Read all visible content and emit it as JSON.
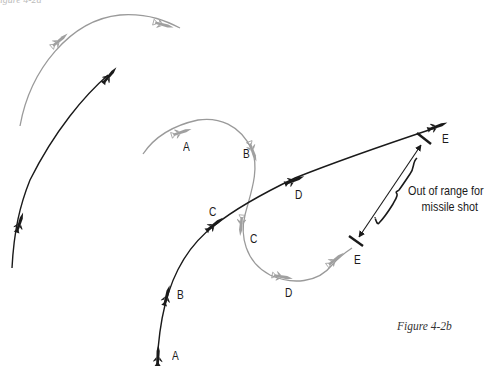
{
  "figure": {
    "caption": "Figure 4-2b",
    "top_fragment": "igure 4-2a",
    "annotation": {
      "line1": "Out of range for",
      "line2": "missile shot"
    }
  },
  "colors": {
    "friendly_path": "#1a1a1a",
    "bandit_path": "#9a9a9a",
    "background": "#ffffff"
  },
  "left_panel": {
    "description": "Earlier engagement: gray bandit arc over black fighter arc",
    "bandit_icons": 2,
    "fighter_icons": 2
  },
  "main_panel": {
    "fighter_labels": [
      "A",
      "B",
      "C",
      "D",
      "E"
    ],
    "bandit_labels": [
      "A",
      "B",
      "C",
      "D",
      "E"
    ],
    "range_marker": {
      "start_label": "E",
      "end_label": "E"
    }
  }
}
